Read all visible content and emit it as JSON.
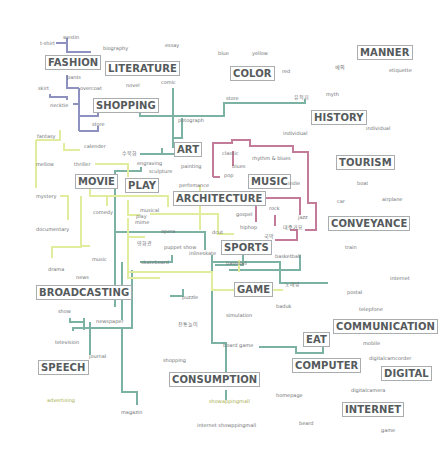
{
  "diagram": {
    "colors": {
      "fashion_line": "#8c91c0",
      "media_line": "#7bb2a4",
      "performance_line": "#e1ec9c",
      "music_line": "#c27b98",
      "category_text": "#555a5c",
      "term_text": "#6f7375",
      "box_border": "#a9adaf"
    },
    "categories": {
      "fashion": "FASHION",
      "literature": "LITERATURE",
      "color": "COLOR",
      "manner": "MANNER",
      "shopping": "SHOPPING",
      "history": "HISTORY",
      "art": "ART",
      "movie": "MOVIE",
      "play": "PLAY",
      "music": "MUSIC",
      "tourism": "TOURISM",
      "architecture": "ARCHITECTURE",
      "conveyance": "CONVEYANCE",
      "sports": "SPORTS",
      "game": "GAME",
      "broadcasting": "BROADCASTING",
      "communication": "COMMUNICATION",
      "eat": "EAT",
      "speech": "SPEECH",
      "computer": "COMPUTER",
      "digital": "DIGITAL",
      "consumption": "CONSUMPTION",
      "internet": "INTERNET"
    },
    "terms": {
      "westin": "westin",
      "tshirt": "t-shirt",
      "biography": "biography",
      "essay": "essay",
      "blue": "blue",
      "yellow": "yellow",
      "red": "red",
      "yeui": "예의",
      "etiquette": "etiquette",
      "pants": "pants",
      "overcoat": "overcoat",
      "skirt": "skirt",
      "novel": "novel",
      "comic": "comic",
      "necktie": "necktie",
      "store": "store",
      "yujeokji": "유적지",
      "myth": "myth",
      "stem": "store",
      "potograph": "potograph",
      "individual1": "individual",
      "individual2": "individual",
      "fantasy": "fantasy",
      "calender": "calender",
      "sueop": "수묵화",
      "engraving": "engraving",
      "painting": "painting",
      "classic": "classic",
      "rhythm_blues": "rhythm & blues",
      "blues": "blues",
      "pop": "pop",
      "mellow": "mellow",
      "thriller": "thriller",
      "sculpture": "sculpture",
      "indie": "indie",
      "boat": "boat",
      "performance": "perfomance",
      "car": "car",
      "airplane": "airplane",
      "mystery": "mystery",
      "comedy": "comedy",
      "musical": "musical",
      "play_term": "play",
      "mime": "mime",
      "gospel": "gospel",
      "rock": "rock",
      "jazz": "jazz",
      "hiphop": "hiphop",
      "daejungga": "대중가요",
      "documentary": "documentary",
      "opera": "opera",
      "gukak": "국악",
      "dcut": "dcut",
      "train": "train",
      "yeongeuk": "영화관",
      "puppet_show": "puppet show",
      "inlineskate": "inlineskate",
      "music_term": "music",
      "skateboard": "skateboard",
      "baseball": "baseball",
      "basketball": "basketball",
      "drama": "drama",
      "news": "news",
      "nori": "노래방",
      "internet_term": "internet",
      "puzzle": "puzzle",
      "postal": "postal",
      "show": "show",
      "baduk": "baduk",
      "telepfone": "telepfone",
      "newspaper": "newspaper",
      "simulation": "simulation",
      "jeontongnori": "전통놀이",
      "television": "television",
      "journal": "journal",
      "board_game": "board game",
      "mobile": "mobile",
      "shopping_term": "shopping",
      "digitalcamcorder": "digitalcamcorder",
      "advertising": "advertising",
      "homepage": "homepage",
      "digitalcamera": "digitalcamera",
      "showappingmall": "showappingmall",
      "magazin": "magazin",
      "internet_shopping": "internet showppingmall",
      "beard": "beard",
      "game_term": "game"
    }
  }
}
